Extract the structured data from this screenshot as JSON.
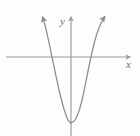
{
  "figure": {
    "background_color": "#fdfdfd",
    "stroke_color": "#8d8d90",
    "axis_color": "#9a9a9d",
    "label_color": "#6e6e70",
    "top_artifact_text": "·  ·  ·  ·"
  },
  "axes": {
    "x_axis": {
      "label": "x",
      "label_x": 127,
      "label_y": 68,
      "line": {
        "x1": 6,
        "y1": 57,
        "x2": 130,
        "y2": 57
      },
      "arrow": "right"
    },
    "y_axis": {
      "label": "y",
      "label_x": 60,
      "label_y": 25,
      "line": {
        "x1": 71,
        "y1": 136,
        "x2": 71,
        "y2": 17
      },
      "arrow": "up"
    }
  },
  "chart_data": {
    "type": "line",
    "xlabel": "x",
    "ylabel": "y",
    "grid": false,
    "legend": null,
    "curves": [
      {
        "name": "parabola",
        "shape": "upward-opening parabola",
        "vertex_px": {
          "x": 71,
          "y": 123
        },
        "x_intercepts_px": [
          52,
          91
        ],
        "left_arrow_tip_px": {
          "x": 42,
          "y": 15
        },
        "right_arrow_tip_px": {
          "x": 106,
          "y": 15
        },
        "arrowheads": [
          "left-branch-up",
          "right-branch-up"
        ],
        "points_px": [
          {
            "x": 42,
            "y": 15
          },
          {
            "x": 45,
            "y": 25
          },
          {
            "x": 48,
            "y": 38
          },
          {
            "x": 52,
            "y": 57
          },
          {
            "x": 56,
            "y": 76
          },
          {
            "x": 60,
            "y": 94
          },
          {
            "x": 64,
            "y": 109
          },
          {
            "x": 68,
            "y": 120
          },
          {
            "x": 71,
            "y": 123
          },
          {
            "x": 75,
            "y": 120
          },
          {
            "x": 79,
            "y": 111
          },
          {
            "x": 83,
            "y": 96
          },
          {
            "x": 87,
            "y": 76
          },
          {
            "x": 91,
            "y": 57
          },
          {
            "x": 95,
            "y": 40
          },
          {
            "x": 99,
            "y": 28
          },
          {
            "x": 103,
            "y": 19
          },
          {
            "x": 106,
            "y": 15
          }
        ]
      }
    ]
  }
}
